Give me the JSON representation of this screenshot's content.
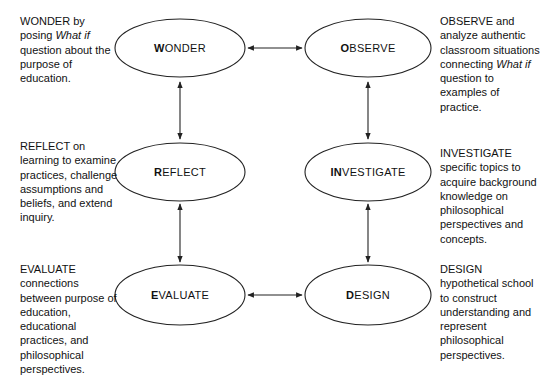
{
  "diagram": {
    "stroke_color": "#222222",
    "text_color": "#111111",
    "background_color": "#ffffff",
    "nodes": [
      {
        "id": "wonder",
        "initial": "W",
        "rest": "ONDER",
        "cx": 180,
        "cy": 48,
        "rx": 65,
        "ry": 29
      },
      {
        "id": "observe",
        "initial": "O",
        "rest": "BSERVE",
        "cx": 368,
        "cy": 48,
        "rx": 63,
        "ry": 29
      },
      {
        "id": "reflect",
        "initial": "R",
        "rest": "EFLECT",
        "cx": 180,
        "cy": 172,
        "rx": 65,
        "ry": 29
      },
      {
        "id": "investigate",
        "initial": "IN",
        "rest": "VESTIGATE",
        "cx": 368,
        "cy": 172,
        "rx": 63,
        "ry": 29
      },
      {
        "id": "evaluate",
        "initial": "E",
        "rest": "VALUATE",
        "cx": 180,
        "cy": 295,
        "rx": 65,
        "ry": 30
      },
      {
        "id": "design",
        "initial": "D",
        "rest": "ESIGN",
        "cx": 368,
        "cy": 295,
        "rx": 63,
        "ry": 30
      }
    ],
    "connectors": [
      {
        "id": "wonder-observe",
        "orientation": "horizontal",
        "x1": 248,
        "y1": 48,
        "x2": 302,
        "y2": 48,
        "double": true
      },
      {
        "id": "evaluate-design",
        "orientation": "horizontal",
        "x1": 248,
        "y1": 295,
        "x2": 302,
        "y2": 295,
        "double": true
      },
      {
        "id": "wonder-reflect",
        "orientation": "vertical",
        "x1": 180,
        "y1": 82,
        "x2": 180,
        "y2": 139,
        "double": true
      },
      {
        "id": "observe-investigate",
        "orientation": "vertical",
        "x1": 368,
        "y1": 82,
        "x2": 368,
        "y2": 139,
        "double": true
      },
      {
        "id": "reflect-evaluate",
        "orientation": "vertical",
        "x1": 180,
        "y1": 204,
        "x2": 180,
        "y2": 262,
        "double": true
      },
      {
        "id": "investigate-design",
        "orientation": "vertical",
        "x1": 368,
        "y1": 204,
        "x2": 368,
        "y2": 262,
        "double": true
      }
    ],
    "descriptions": [
      {
        "id": "wonder-desc",
        "side": "left",
        "x": 20,
        "y": 14,
        "width": 96,
        "segments": [
          {
            "text": "WONDER by posing ",
            "style": "normal"
          },
          {
            "text": "What if",
            "style": "italic"
          },
          {
            "text": " question about the purpose of education.",
            "style": "normal"
          }
        ],
        "plain": "WONDER by posing What if question about the purpose of education."
      },
      {
        "id": "observe-desc",
        "side": "right",
        "x": 440,
        "y": 14,
        "width": 103,
        "segments": [
          {
            "text": "OBSERVE and analyze authentic classroom situations connecting ",
            "style": "normal"
          },
          {
            "text": "What if",
            "style": "italic"
          },
          {
            "text": " question to examples of practice.",
            "style": "normal"
          }
        ],
        "plain": "OBSERVE and analyze authentic classroom situations connecting What if question to examples of practice."
      },
      {
        "id": "reflect-desc",
        "side": "left",
        "x": 20,
        "y": 139,
        "width": 98,
        "segments": [
          {
            "text": "REFLECT on learning to examine practices, challenge assumptions and beliefs, and extend inquiry.",
            "style": "normal"
          }
        ],
        "plain": "REFLECT on learning to examine practices, challenge assumptions and beliefs, and extend inquiry."
      },
      {
        "id": "investigate-desc",
        "side": "right",
        "x": 440,
        "y": 146,
        "width": 103,
        "segments": [
          {
            "text": "INVESTIGATE specific topics to acquire background knowledge on philosophical perspectives and concepts.",
            "style": "normal"
          }
        ],
        "plain": "INVESTIGATE specific topics to acquire background knowledge on philosophical perspectives and concepts."
      },
      {
        "id": "evaluate-desc",
        "side": "left",
        "x": 20,
        "y": 262,
        "width": 100,
        "segments": [
          {
            "text": "EVALUATE connections between purpose of education, educational practices, and philosophical perspectives.",
            "style": "normal"
          }
        ],
        "plain": "EVALUATE connections between purpose of education, educational practices, and philosophical perspectives."
      },
      {
        "id": "design-desc",
        "side": "right",
        "x": 440,
        "y": 262,
        "width": 103,
        "segments": [
          {
            "text": "DESIGN hypothetical school to construct understanding and represent philosophical perspectives.",
            "style": "normal"
          }
        ],
        "plain": "DESIGN hypothetical school to construct understanding and represent philosophical perspectives."
      }
    ]
  }
}
